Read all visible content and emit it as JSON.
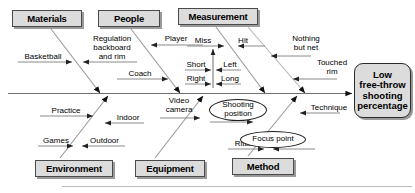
{
  "diagram": {
    "type": "fishbone-ishikawa",
    "effect": {
      "label": "Low free-throw shooting percentage",
      "lines": [
        "Low",
        "free-throw",
        "shooting",
        "percentage"
      ]
    },
    "spine": {
      "arrow": "right"
    },
    "categories": [
      {
        "id": "materials",
        "label": "Materials",
        "position": "top"
      },
      {
        "id": "people",
        "label": "People",
        "position": "top"
      },
      {
        "id": "measurement",
        "label": "Measurement",
        "position": "top"
      },
      {
        "id": "environment",
        "label": "Environment",
        "position": "bottom"
      },
      {
        "id": "equipment",
        "label": "Equipment",
        "position": "bottom"
      },
      {
        "id": "method",
        "label": "Method",
        "position": "bottom"
      }
    ],
    "causes": [
      {
        "id": "basketball",
        "label": "Basketball",
        "category": "materials",
        "shape": "plain"
      },
      {
        "id": "regulation-backboard-and-rim",
        "label": "Regulation backboard and rim",
        "lines": [
          "Regulation",
          "backboard",
          "and rim"
        ],
        "category": "materials",
        "shape": "plain"
      },
      {
        "id": "player",
        "label": "Player",
        "category": "people",
        "shape": "plain"
      },
      {
        "id": "coach",
        "label": "Coach",
        "category": "people",
        "shape": "plain"
      },
      {
        "id": "miss",
        "label": "Miss",
        "category": "measurement",
        "shape": "plain"
      },
      {
        "id": "hit",
        "label": "Hit",
        "category": "measurement",
        "shape": "plain"
      },
      {
        "id": "short",
        "label": "Short",
        "category": "measurement",
        "parent": "miss",
        "shape": "plain"
      },
      {
        "id": "right",
        "label": "Right",
        "category": "measurement",
        "parent": "miss",
        "shape": "plain"
      },
      {
        "id": "left",
        "label": "Left",
        "category": "measurement",
        "parent": "miss",
        "shape": "plain"
      },
      {
        "id": "long",
        "label": "Long",
        "category": "measurement",
        "parent": "miss",
        "shape": "plain"
      },
      {
        "id": "nothing-but-net",
        "label": "Nothing but net",
        "lines": [
          "Nothing",
          "but net"
        ],
        "category": "measurement",
        "shape": "plain"
      },
      {
        "id": "touched-rim",
        "label": "Touched rim",
        "lines": [
          "Touched",
          "rim"
        ],
        "category": "measurement",
        "shape": "plain"
      },
      {
        "id": "practice",
        "label": "Practice",
        "category": "environment",
        "shape": "plain"
      },
      {
        "id": "games",
        "label": "Games",
        "category": "environment",
        "shape": "plain"
      },
      {
        "id": "indoor",
        "label": "Indoor",
        "category": "environment",
        "shape": "plain"
      },
      {
        "id": "outdoor",
        "label": "Outdoor",
        "category": "environment",
        "shape": "plain"
      },
      {
        "id": "video-camera",
        "label": "Video camera",
        "lines": [
          "Video",
          "camera"
        ],
        "category": "equipment",
        "shape": "plain"
      },
      {
        "id": "shooting-position",
        "label": "Shooting position",
        "lines": [
          "Shooting",
          "position"
        ],
        "category": "method",
        "shape": "ellipse"
      },
      {
        "id": "technique",
        "label": "Technique",
        "category": "method",
        "shape": "plain"
      },
      {
        "id": "ritual",
        "label": "Ritual",
        "category": "method",
        "shape": "plain"
      },
      {
        "id": "focus-point",
        "label": "Focus point",
        "category": "method",
        "shape": "ellipse"
      }
    ],
    "colors": {
      "box_fill": "#dcdcdc",
      "box_border": "#4a4a4a",
      "line": "#6f6f6f",
      "text": "#000000",
      "background": "#ffffff"
    }
  }
}
